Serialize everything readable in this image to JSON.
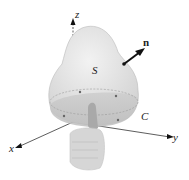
{
  "figure": {
    "type": "stokes-theorem-diagram",
    "labels": {
      "z_axis": "z",
      "y_axis": "y",
      "x_axis": "x",
      "surface": "S",
      "normal": "n",
      "curve": "C"
    },
    "colors": {
      "surface": "#e4e4e4",
      "surface_bottom": "#c8c8c8",
      "axis": "#333333",
      "hand": "#d0d0d0",
      "arrow": "#111111"
    }
  }
}
